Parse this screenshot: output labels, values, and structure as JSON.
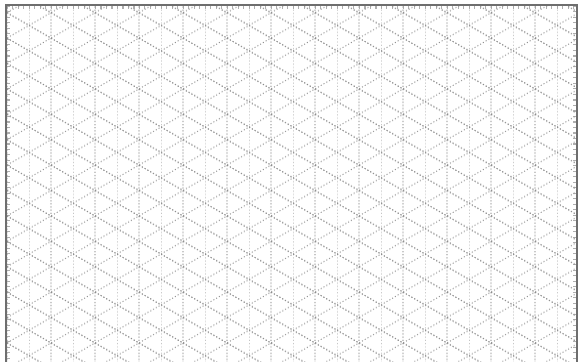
{
  "canvas": {
    "width": 581,
    "height": 362,
    "background": "#ffffff"
  },
  "grid": {
    "type": "isometric-dotted",
    "line_color": "#8a8a8a",
    "border_color": "#6e6e6e",
    "vertical_spacing_px": 22,
    "first_vertical_x": 29,
    "diagonal_angle_deg": 30,
    "row_period_px": 25.4
  }
}
